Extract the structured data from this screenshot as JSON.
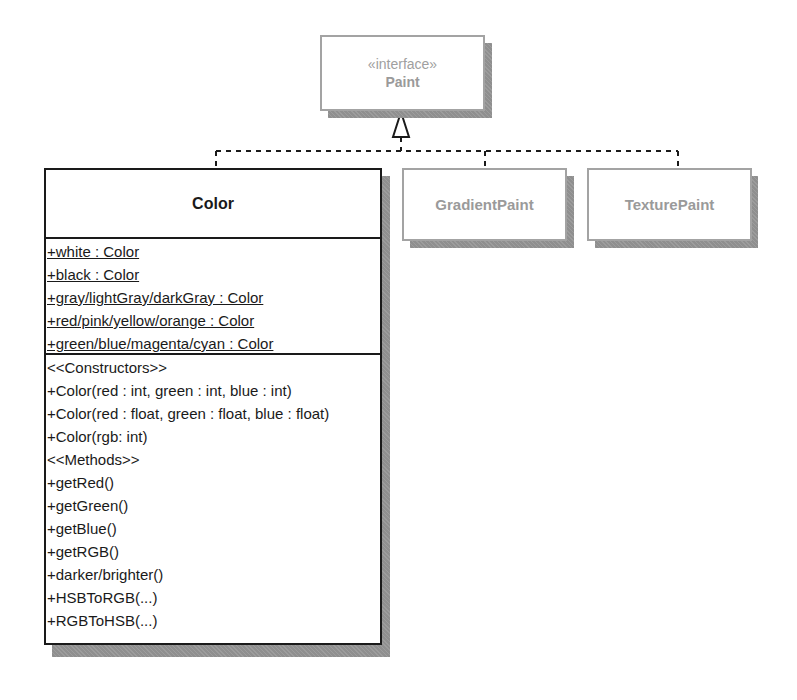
{
  "diagram": {
    "type": "uml-class-diagram",
    "interface": {
      "stereotype": "«interface»",
      "name": "Paint"
    },
    "implementations": [
      {
        "name": "Color"
      },
      {
        "name": "GradientPaint"
      },
      {
        "name": "TexturePaint"
      }
    ],
    "color_class": {
      "name": "Color",
      "attributes": [
        "+white : Color",
        "+black : Color",
        "+gray/lightGray/darkGray : Color",
        "+red/pink/yellow/orange : Color",
        "+green/blue/magenta/cyan : Color"
      ],
      "operations": [
        "<<Constructors>>",
        "+Color(red : int, green : int, blue : int)",
        "+Color(red : float, green : float, blue : float)",
        "+Color(rgb: int)",
        "<<Methods>>",
        "+getRed()",
        "+getGreen()",
        "+getBlue()",
        "+getRGB()",
        "+darker/brighter()",
        "+HSBToRGB(...)",
        "+RGBToHSB(...)"
      ]
    },
    "relationships": [
      {
        "from": "Color",
        "to": "Paint",
        "kind": "realization"
      },
      {
        "from": "GradientPaint",
        "to": "Paint",
        "kind": "realization"
      },
      {
        "from": "TexturePaint",
        "to": "Paint",
        "kind": "realization"
      }
    ],
    "colors": {
      "solid_border": "#1a1a1a",
      "faded_border": "#a3a3a3",
      "faded_text": "#9a9a9a",
      "shadow": "#8f8f8f"
    }
  }
}
